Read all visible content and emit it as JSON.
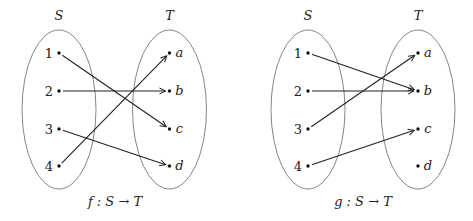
{
  "diagrams": [
    {
      "domain_label": "S",
      "codomain_label": "T",
      "domain": [
        "1",
        "2",
        "3",
        "4"
      ],
      "codomain": [
        "a",
        "b",
        "c",
        "d"
      ],
      "mapping": {
        "1": "c",
        "2": "b",
        "3": "d",
        "4": "a"
      },
      "caption": "f : S → T"
    },
    {
      "domain_label": "S",
      "codomain_label": "T",
      "domain": [
        "1",
        "2",
        "3",
        "4"
      ],
      "codomain": [
        "a",
        "b",
        "c",
        "d"
      ],
      "mapping": {
        "1": "b",
        "2": "b",
        "3": "a",
        "4": "c"
      },
      "caption": "g : S → T"
    }
  ]
}
